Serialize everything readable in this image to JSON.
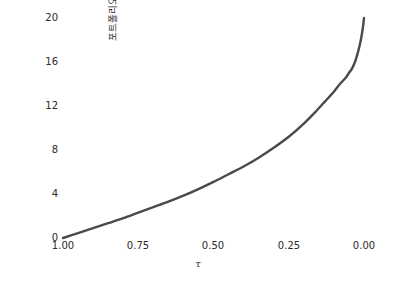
{
  "chart_data": {
    "type": "line",
    "title": "",
    "xlabel": "τ",
    "ylabel": "포트폴리오 가치",
    "xlim": [
      1.0,
      0.0
    ],
    "ylim": [
      0,
      20
    ],
    "x_inverted": true,
    "grid": false,
    "legend": null,
    "line_color": "#4a4a4a",
    "line_width": 2.4,
    "xticks": [
      "1.00",
      "0.75",
      "0.50",
      "0.25",
      "0.00"
    ],
    "xtick_values": [
      1.0,
      0.75,
      0.5,
      0.25,
      0.0
    ],
    "yticks": [
      "0",
      "4",
      "8",
      "12",
      "16",
      "20"
    ],
    "ytick_values": [
      0,
      4,
      8,
      12,
      16,
      20
    ],
    "series": [
      {
        "name": "포트폴리오 가치",
        "x": [
          1.0,
          0.95,
          0.9,
          0.85,
          0.8,
          0.75,
          0.7,
          0.65,
          0.6,
          0.55,
          0.5,
          0.45,
          0.4,
          0.35,
          0.3,
          0.25,
          0.2,
          0.16,
          0.13,
          0.1,
          0.08,
          0.06,
          0.05,
          0.04,
          0.03,
          0.02,
          0.012,
          0.006,
          0.002,
          0.0
        ],
        "values": [
          0.0,
          0.45,
          0.9,
          1.35,
          1.8,
          2.3,
          2.8,
          3.3,
          3.85,
          4.45,
          5.1,
          5.8,
          6.5,
          7.3,
          8.2,
          9.2,
          10.4,
          11.5,
          12.4,
          13.3,
          14.0,
          14.6,
          15.0,
          15.4,
          16.0,
          16.9,
          17.8,
          18.7,
          19.5,
          20.0
        ]
      }
    ]
  },
  "axis": {
    "ylabel_text": "포트폴리오 가치",
    "xlabel_text": "τ"
  }
}
